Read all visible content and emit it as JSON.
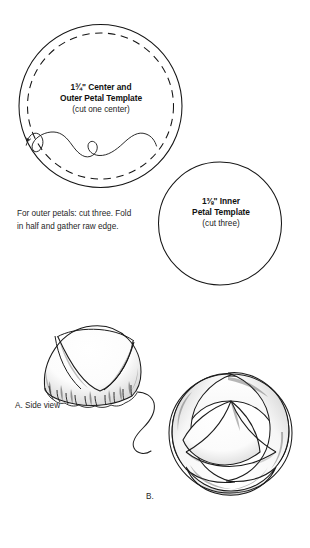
{
  "document": {
    "title": "Petal Template Sewing Diagram",
    "background_color": "#ffffff",
    "ink_color": "#1a1a1a"
  },
  "templates": {
    "outer": {
      "size_whole": "1",
      "size_numerator": "3",
      "size_denominator": "4",
      "size_unit": "\"",
      "size_text": "1¾\"",
      "line1": "1¾\" Center and",
      "line2": "Outer Petal Template",
      "line3": "(cut one center)",
      "shape": "circle",
      "has_dashed_inner_circle": true,
      "has_thread_squiggle": true
    },
    "inner": {
      "size_whole": "1",
      "size_numerator": "3",
      "size_denominator": "8",
      "size_unit": "\"",
      "size_text": "1⅜\"",
      "line1": "1⅜\" Inner",
      "line2": "Petal Template",
      "line3": "(cut three)",
      "shape": "circle",
      "has_dashed_inner_circle": false,
      "has_thread_squiggle": false
    }
  },
  "instructions": {
    "outer_petals": "For outer petals: cut three. Fold in half and gather raw edge."
  },
  "figures": [
    {
      "id": "figure-a",
      "caption": "A. Side view",
      "description": "gathered dome petal side view with thread tail"
    },
    {
      "id": "figure-b",
      "caption": "B.",
      "description": "three interwoven petals top view forming rounded triangle"
    }
  ]
}
